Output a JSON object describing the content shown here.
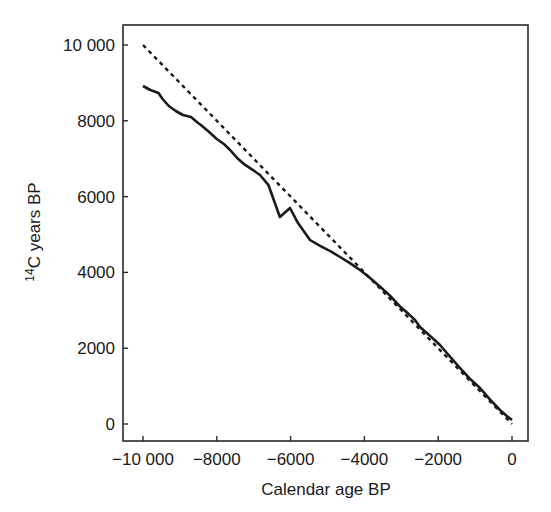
{
  "chart_data": {
    "type": "line",
    "title": "",
    "xlabel": "Calendar age BP",
    "ylabel": "14C years BP",
    "ylabel_parts": {
      "superscript": "14",
      "rest": "C years BP"
    },
    "xlim": [
      -10400,
      700
    ],
    "ylim": [
      -500,
      10500
    ],
    "x_ticks": [
      -10000,
      -8000,
      -6000,
      -4000,
      -2000,
      0
    ],
    "x_tick_labels": [
      "−10 000",
      "−8000",
      "−6000",
      "−4000",
      "−2000",
      "0"
    ],
    "y_ticks": [
      0,
      2000,
      4000,
      6000,
      8000,
      10000
    ],
    "y_tick_labels": [
      "0",
      "2000",
      "4000",
      "6000",
      "8000",
      "10 000"
    ],
    "grid": false,
    "legend": null,
    "series": [
      {
        "name": "radiocarbon-calibration-curve",
        "style": "solid",
        "color": "#1a1a1a",
        "x": [
          -10000,
          -9800,
          -9580,
          -9470,
          -9300,
          -9110,
          -8920,
          -8700,
          -8510,
          -8430,
          -8200,
          -8000,
          -7800,
          -7640,
          -7450,
          -7250,
          -7050,
          -6830,
          -6600,
          -6290,
          -6016,
          -5800,
          -5474,
          -5200,
          -4900,
          -4661,
          -4400,
          -4100,
          -3848,
          -3550,
          -3300,
          -3035,
          -2800,
          -2629,
          -2493,
          -2250,
          -1951,
          -1700,
          -1409,
          -1150,
          -867,
          -600,
          -325,
          -150,
          0
        ],
        "y": [
          8918,
          8813,
          8734,
          8575,
          8391,
          8259,
          8153,
          8100,
          7942,
          7889,
          7700,
          7520,
          7380,
          7230,
          7020,
          6850,
          6720,
          6570,
          6300,
          5462,
          5699,
          5300,
          4855,
          4700,
          4550,
          4406,
          4250,
          4050,
          3852,
          3600,
          3380,
          3100,
          2900,
          2744,
          2559,
          2350,
          2084,
          1800,
          1478,
          1200,
          950,
          650,
          369,
          220,
          106
        ]
      },
      {
        "name": "one-to-one-reference",
        "style": "dashed",
        "color": "#1a1a1a",
        "x": [
          -10000,
          0
        ],
        "y": [
          10000,
          0
        ]
      }
    ]
  },
  "layout": {
    "plot_box": {
      "left": 123,
      "top": 25,
      "right": 528,
      "bottom": 441
    },
    "x_map": {
      "v0": -10000,
      "p0": 143,
      "v1": 0,
      "p1": 512
    },
    "y_map": {
      "v0": 0,
      "p0": 424,
      "v1": 10000,
      "p1": 45
    }
  }
}
